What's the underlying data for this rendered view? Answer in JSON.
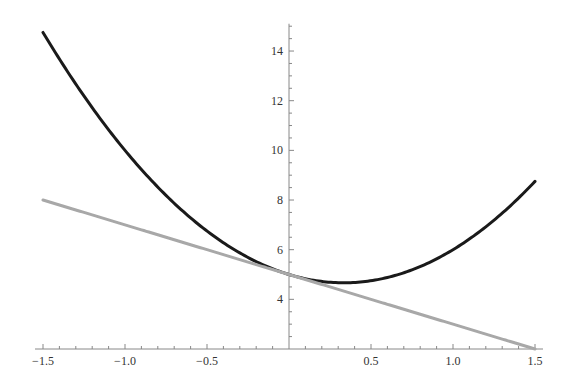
{
  "chart_data": {
    "type": "line",
    "title": "",
    "xlabel": "",
    "ylabel": "",
    "xlim": [
      -1.5,
      1.5
    ],
    "ylim": [
      2,
      15
    ],
    "grid": false,
    "legend": null,
    "x_ticks": [
      -1.5,
      -1.0,
      -0.5,
      0.5,
      1.0,
      1.5
    ],
    "x_tick_labels": [
      "−1.5",
      "−1.0",
      "−0.5",
      "0.5",
      "1.0",
      "1.5"
    ],
    "x_minor_step": 0.1,
    "y_ticks": [
      4,
      6,
      8,
      10,
      12,
      14
    ],
    "y_tick_labels": [
      "4",
      "6",
      "8",
      "10",
      "12",
      "14"
    ],
    "y_minor_step": 0.5,
    "series": [
      {
        "name": "f(x) = 3x² − 2x + 5",
        "color": "#1a1a1a",
        "width": 3,
        "coeffs": [
          3,
          -2,
          5
        ],
        "x": [
          -1.5,
          -1.0,
          -0.5,
          0.0,
          0.3333,
          0.5,
          1.0,
          1.5
        ],
        "y": [
          14.75,
          10.0,
          6.75,
          5.0,
          4.667,
          4.75,
          6.0,
          8.75
        ]
      },
      {
        "name": "tangent line y = 5 − 2x",
        "color": "#a8a8a8",
        "width": 3,
        "coeffs": [
          0,
          -2,
          5
        ],
        "x": [
          -1.5,
          0.0,
          1.5
        ],
        "y": [
          8.0,
          5.0,
          2.0
        ]
      }
    ]
  },
  "layout": {
    "origin_px": [
      289,
      349
    ],
    "x_px_per_unit": 164,
    "y_px_per_unit": 24.83,
    "y_axis_top_value": 15.1
  }
}
